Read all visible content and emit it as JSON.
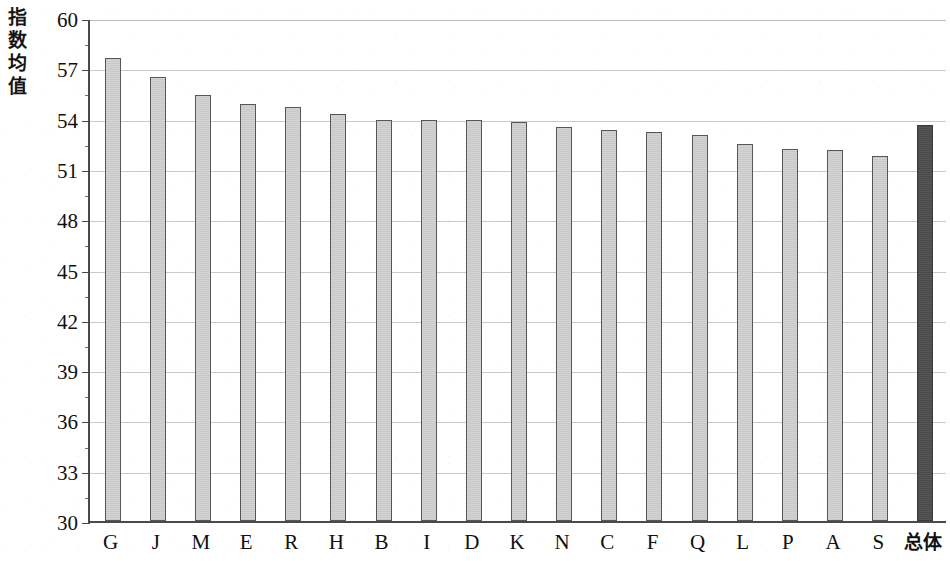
{
  "chart_data": {
    "type": "bar",
    "title": "",
    "xlabel": "",
    "ylabel": "指数均值",
    "ylim": [
      30,
      60
    ],
    "ytick_step": 3,
    "ytick_labels": [
      "60",
      "57",
      "54",
      "51",
      "48",
      "45",
      "42",
      "39",
      "36",
      "33",
      "30"
    ],
    "grid": true,
    "legend": "none",
    "categories": [
      "G",
      "J",
      "M",
      "E",
      "R",
      "H",
      "B",
      "I",
      "D",
      "K",
      "N",
      "C",
      "F",
      "Q",
      "L",
      "P",
      "A",
      "S",
      "总体"
    ],
    "values": [
      57.6,
      56.5,
      55.4,
      54.9,
      54.7,
      54.3,
      53.9,
      53.9,
      53.9,
      53.8,
      53.5,
      53.3,
      53.2,
      53.0,
      52.5,
      52.2,
      52.1,
      51.8,
      53.6
    ],
    "highlight_index": 18,
    "highlight_label": "总体",
    "bar_color": "#d2d2d2",
    "bar_border_color": "#575757",
    "highlight_bar_color": "#4d4d4d",
    "gridline_color": "#c9c9c9",
    "axis_color": "#4a4a4a"
  },
  "axis": {
    "y_title_chars": "指\n数\n均\n值"
  }
}
